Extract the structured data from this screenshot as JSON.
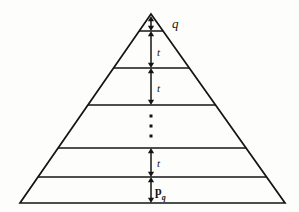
{
  "figure": {
    "name": "layered-pyramid-diagram",
    "type": "geometric-diagram",
    "background_color": "#fdfdfb",
    "stroke_color": "#141414"
  },
  "triangle": {
    "apex": {
      "x": 151,
      "y": 14
    },
    "base_left": {
      "x": 20,
      "y": 203
    },
    "base_right": {
      "x": 285,
      "y": 203
    },
    "stroke_width": 1.7
  },
  "dividers": [
    {
      "id": "divider-1",
      "y": 31
    },
    {
      "id": "divider-2",
      "y": 68
    },
    {
      "id": "divider-3",
      "y": 105
    },
    {
      "id": "divider-4",
      "y": 148
    },
    {
      "id": "divider-5",
      "y": 177
    }
  ],
  "axis": {
    "x": 151
  },
  "arrows": [
    {
      "id": "arrow-apex-to-d1",
      "top": 16,
      "bottom": 31,
      "heads": "both"
    },
    {
      "id": "arrow-d1-to-d2",
      "top": 31,
      "bottom": 68,
      "heads": "both"
    },
    {
      "id": "arrow-d2-to-d3",
      "top": 68,
      "bottom": 105,
      "heads": "both"
    },
    {
      "id": "arrow-d4-to-d5",
      "top": 148,
      "bottom": 177,
      "heads": "both"
    },
    {
      "id": "arrow-d5-to-base",
      "top": 177,
      "bottom": 203,
      "heads": "both"
    }
  ],
  "ellipsis": {
    "dots": [
      {
        "x": 151,
        "y": 116
      },
      {
        "x": 151,
        "y": 126
      },
      {
        "x": 151,
        "y": 136
      }
    ],
    "size": 3
  },
  "labels": {
    "apex": {
      "text": "q",
      "x": 172,
      "y": 17
    },
    "band_1": {
      "text": "t",
      "x": 157,
      "y": 47
    },
    "band_2": {
      "text": "t",
      "x": 157,
      "y": 83
    },
    "band_lower": {
      "text": "t",
      "x": 157,
      "y": 158
    },
    "bottom_base": {
      "text": "p",
      "subscript": "q",
      "x": 155,
      "y": 185
    }
  }
}
